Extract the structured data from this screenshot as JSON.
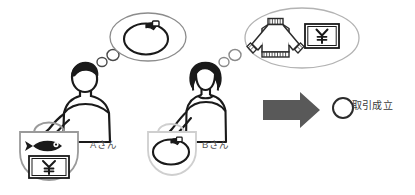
{
  "diagram": {
    "background_color": "#ffffff",
    "persons": [
      {
        "id": "person-a",
        "label": "Aさん",
        "gender_appearance": "man",
        "outline_color": "#1a1a1a",
        "holds": {
          "container": "tote-bag",
          "container_color": "#9a9a9a",
          "contents": [
            "fish",
            "yen-banknote"
          ]
        },
        "thinks_about": {
          "bubble_color": "#8c8c8c",
          "items": [
            "round-pot-item"
          ]
        }
      },
      {
        "id": "person-b",
        "label": "Bさん",
        "gender_appearance": "woman",
        "outline_color": "#1a1a1a",
        "holds": {
          "container": "tote-bag",
          "container_color": "#cfcfcf",
          "contents": [
            "round-pot-item"
          ]
        },
        "thinks_about": {
          "bubble_color": "#b3b3b3",
          "items": [
            "sweater",
            "yen-banknote"
          ]
        }
      }
    ],
    "arrow": {
      "direction": "right",
      "color": "#595959"
    },
    "result": {
      "marker": "○",
      "marker_color": "#2b2b2b",
      "text": "取引成立"
    },
    "currency_symbol": "¥",
    "colors": {
      "ink": "#1a1a1a",
      "mid_gray": "#8c8c8c",
      "light_gray": "#cfcfcf",
      "arrow_gray": "#595959",
      "text_gray": "#555555"
    }
  }
}
